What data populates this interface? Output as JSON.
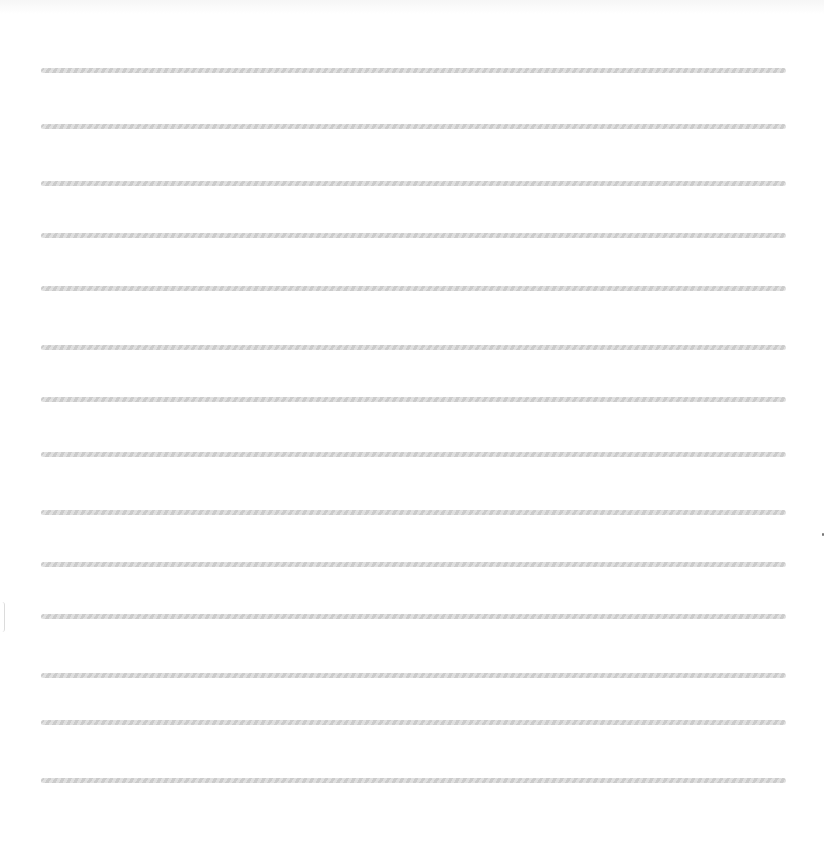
{
  "sheet": {
    "type": "lined-paper",
    "background": "#ffffff",
    "rule_color": "#cfcfcf",
    "rule_left": 41,
    "rule_right": 786,
    "rule_thickness": 5,
    "rules_y": [
      70,
      126,
      183,
      235,
      288,
      347,
      399,
      454,
      512,
      564,
      616,
      675,
      722,
      780
    ]
  }
}
